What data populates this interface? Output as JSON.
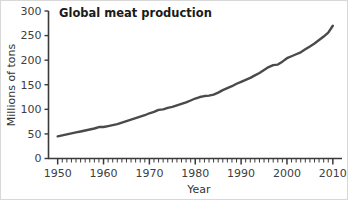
{
  "chart_data": {
    "type": "line",
    "title": "Global meat production",
    "xlabel": "Year",
    "ylabel": "Millions of tons",
    "xlim": [
      1948,
      2012
    ],
    "ylim": [
      0,
      300
    ],
    "grid": false,
    "legend": false,
    "line_color": "#4a4a4a",
    "axis_color": "#3a3a3a",
    "x_ticks": [
      1950,
      1960,
      1970,
      1980,
      1990,
      2000,
      2010
    ],
    "x_tick_labels": [
      "1950",
      "1960",
      "1970",
      "1980",
      "1990",
      "2000",
      "2010"
    ],
    "x_minor_tick_interval": 1,
    "y_ticks": [
      0,
      50,
      100,
      150,
      200,
      250,
      300
    ],
    "y_tick_labels": [
      "0",
      "50",
      "100",
      "150",
      "200",
      "250",
      "300"
    ],
    "series": [
      {
        "name": "Global meat production",
        "x": [
          1950,
          1951,
          1952,
          1953,
          1954,
          1955,
          1956,
          1957,
          1958,
          1959,
          1960,
          1961,
          1962,
          1963,
          1964,
          1965,
          1966,
          1967,
          1968,
          1969,
          1970,
          1971,
          1972,
          1973,
          1974,
          1975,
          1976,
          1977,
          1978,
          1979,
          1980,
          1981,
          1982,
          1983,
          1984,
          1985,
          1986,
          1987,
          1988,
          1989,
          1990,
          1991,
          1992,
          1993,
          1994,
          1995,
          1996,
          1997,
          1998,
          1999,
          2000,
          2001,
          2002,
          2003,
          2004,
          2005,
          2006,
          2007,
          2008,
          2009,
          2010
        ],
        "values": [
          45,
          47,
          49,
          51,
          53,
          55,
          57,
          59,
          61,
          64,
          64,
          66,
          68,
          70,
          73,
          76,
          79,
          82,
          85,
          88,
          92,
          95,
          99,
          100,
          103,
          105,
          108,
          111,
          114,
          118,
          122,
          125,
          127,
          128,
          130,
          134,
          139,
          143,
          147,
          152,
          156,
          160,
          164,
          169,
          174,
          180,
          186,
          190,
          191,
          197,
          204,
          208,
          212,
          216,
          222,
          228,
          234,
          241,
          248,
          256,
          270
        ],
        "units": "million tons"
      }
    ]
  },
  "figure": {
    "title": "Global meat production",
    "y_axis_title": "Millions of tons",
    "x_axis_title": "Year"
  }
}
